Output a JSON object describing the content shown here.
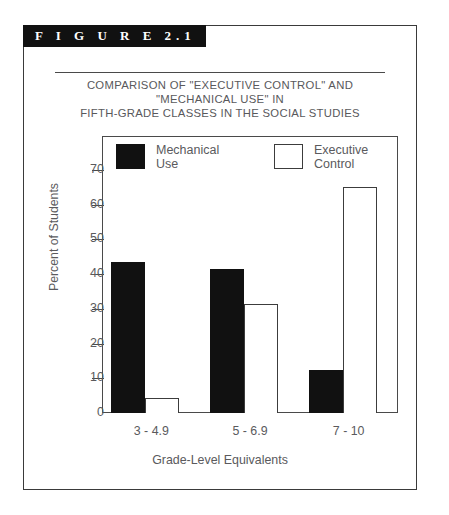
{
  "figure": {
    "banner_label": "F I G U R E  2.1",
    "title_lines": [
      "COMPARISON OF \"EXECUTIVE CONTROL\" AND",
      "\"MECHANICAL USE\" IN",
      "FIFTH-GRADE CLASSES IN THE SOCIAL STUDIES"
    ]
  },
  "colors": {
    "mechanical_use": "#111111",
    "executive_control": "#ffffff",
    "outline": "#3c3c3c",
    "text": "#5a5a5d",
    "banner_background": "#111111",
    "banner_text": "#ffffff"
  },
  "chart_data": {
    "type": "bar",
    "title": "COMPARISON OF \"EXECUTIVE CONTROL\" AND \"MECHANICAL USE\" IN FIFTH-GRADE CLASSES IN THE SOCIAL STUDIES",
    "xlabel": "Grade-Level Equivalents",
    "ylabel": "Percent of Students",
    "categories": [
      "3 - 4.9",
      "5 - 6.9",
      "7 - 10"
    ],
    "series": [
      {
        "name": "Mechanical Use",
        "values": [
          43.5,
          41.5,
          12.5
        ]
      },
      {
        "name": "Executive Control",
        "values": [
          4.3,
          31.5,
          65
        ]
      }
    ],
    "ylim": [
      0,
      72
    ],
    "yticks": [
      0,
      10,
      20,
      30,
      40,
      50,
      60,
      70
    ],
    "ytick_labels": [
      "0",
      "10",
      "20",
      "30",
      "40",
      "50",
      "60",
      "70"
    ],
    "grid": false,
    "legend_position": "top-inside"
  }
}
